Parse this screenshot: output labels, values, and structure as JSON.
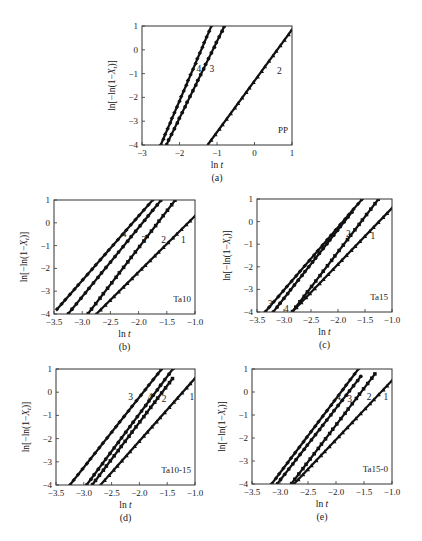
{
  "figure": {
    "panels_order": [
      "a",
      "b",
      "c",
      "d",
      "e"
    ]
  },
  "chart_data": [
    {
      "id": "a",
      "type": "line",
      "caption": "(a)",
      "sample": "PP",
      "xlabel": "ln t",
      "ylabel": "ln[−ln(1−Xt)]",
      "xlim": [
        -3,
        1
      ],
      "ylim": [
        -4,
        1
      ],
      "xticks": [
        "−3",
        "−2",
        "−1",
        "0",
        "1"
      ],
      "xtick_values": [
        -3,
        -2,
        -1,
        0,
        1
      ],
      "yticks": [
        "1",
        "0",
        "−1",
        "−2",
        "−3",
        "−4"
      ],
      "ytick_values": [
        1,
        0,
        -1,
        -2,
        -3,
        -4
      ],
      "grid": false,
      "frame": {
        "x": 142,
        "y": 26,
        "w": 150,
        "h": 119
      },
      "series": [
        {
          "name": "4",
          "marker": "diamond",
          "x": [
            -2.5,
            -1.15
          ],
          "y": [
            -4,
            1
          ],
          "label_at": [
            -1.55,
            -0.8
          ]
        },
        {
          "name": "3",
          "marker": "circle",
          "x": [
            -2.35,
            -0.8
          ],
          "y": [
            -4,
            1
          ],
          "label_at": [
            -1.2,
            -0.8
          ]
        },
        {
          "name": "2",
          "marker": "triangle",
          "x": [
            -1.25,
            1.0
          ],
          "y": [
            -4,
            0.85
          ],
          "label_at": [
            0.6,
            -0.9
          ]
        }
      ]
    },
    {
      "id": "b",
      "type": "line",
      "caption": "(b)",
      "sample": "Ta10",
      "xlabel": "ln t",
      "ylabel": "ln[−ln(1−Xt)]",
      "xlim": [
        -3.5,
        -1.0
      ],
      "ylim": [
        -4,
        1
      ],
      "xticks": [
        "−3.5",
        "−3.0",
        "−2.5",
        "−2.0",
        "−1.5",
        "−1.0"
      ],
      "xtick_values": [
        -3.5,
        -3.0,
        -2.5,
        -2.0,
        -1.5,
        -1.0
      ],
      "yticks": [
        "1",
        "0",
        "−1",
        "−2",
        "−3",
        "−4"
      ],
      "ytick_values": [
        1,
        0,
        -1,
        -2,
        -3,
        -4
      ],
      "grid": false,
      "frame": {
        "x": 54,
        "y": 200,
        "w": 141,
        "h": 114
      },
      "series": [
        {
          "name": "4",
          "marker": "diamond",
          "x": [
            -3.45,
            -1.75
          ],
          "y": [
            -3.8,
            1
          ],
          "label_at": [
            -2.3,
            -0.5
          ]
        },
        {
          "name": "3",
          "marker": "circle",
          "x": [
            -3.25,
            -1.6
          ],
          "y": [
            -4,
            1
          ],
          "label_at": [
            -1.95,
            -0.75
          ]
        },
        {
          "name": "2",
          "marker": "square",
          "x": [
            -2.9,
            -1.35
          ],
          "y": [
            -4,
            1
          ],
          "label_at": [
            -1.6,
            -0.75
          ]
        },
        {
          "name": "1",
          "marker": "triangle",
          "x": [
            -2.75,
            -1.0
          ],
          "y": [
            -4,
            0.3
          ],
          "label_at": [
            -1.25,
            -0.75
          ]
        }
      ]
    },
    {
      "id": "c",
      "type": "line",
      "caption": "(c)",
      "sample": "Ta15",
      "xlabel": "ln t",
      "ylabel": "ln[−ln(1−Xt)]",
      "xlim": [
        -3.5,
        -1.0
      ],
      "ylim": [
        -4,
        1
      ],
      "xticks": [
        "−3.5",
        "−3.0",
        "−2.5",
        "−2.0",
        "−1.5",
        "−1.0"
      ],
      "xtick_values": [
        -3.5,
        -3.0,
        -2.5,
        -2.0,
        -1.5,
        -1.0
      ],
      "yticks": [
        "1",
        "0",
        "−1",
        "−2",
        "−3",
        "−4"
      ],
      "ytick_values": [
        1,
        0,
        -1,
        -2,
        -3,
        -4
      ],
      "grid": false,
      "frame": {
        "x": 257,
        "y": 199,
        "w": 135,
        "h": 113
      },
      "series": [
        {
          "name": "3",
          "marker": "diamond",
          "x": [
            -3.35,
            -1.55
          ],
          "y": [
            -4,
            1
          ],
          "label_at": [
            -3.3,
            -3.65
          ]
        },
        {
          "name": "4",
          "marker": "circle",
          "x": [
            -3.2,
            -1.75
          ],
          "y": [
            -4,
            0.4
          ],
          "label_at": [
            -3.0,
            -3.85
          ]
        },
        {
          "name": "2",
          "marker": "square",
          "x": [
            -2.85,
            -1.25
          ],
          "y": [
            -4,
            1
          ],
          "label_at": [
            -1.85,
            -0.55
          ]
        },
        {
          "name": "1",
          "marker": "triangle",
          "x": [
            -2.85,
            -1.0
          ],
          "y": [
            -4,
            0.6
          ],
          "label_at": [
            -1.4,
            -0.65
          ]
        }
      ]
    },
    {
      "id": "d",
      "type": "line",
      "caption": "(d)",
      "sample": "Ta10-15",
      "xlabel": "ln t",
      "ylabel": "ln[−ln(1−Xt)]",
      "xlim": [
        -3.5,
        -1.0
      ],
      "ylim": [
        -4,
        1
      ],
      "xticks": [
        "−3.5",
        "−3.0",
        "−2.5",
        "−2.0",
        "−1.5",
        "−1.0"
      ],
      "xtick_values": [
        -3.5,
        -3.0,
        -2.5,
        -2.0,
        -1.5,
        -1.0
      ],
      "yticks": [
        "1",
        "0",
        "−1",
        "−2",
        "−3",
        "−4"
      ],
      "ytick_values": [
        1,
        0,
        -1,
        -2,
        -3,
        -4
      ],
      "grid": false,
      "frame": {
        "x": 56,
        "y": 369,
        "w": 139,
        "h": 116
      },
      "series": [
        {
          "name": "3",
          "marker": "diamond",
          "x": [
            -3.25,
            -1.6
          ],
          "y": [
            -4,
            1
          ],
          "label_at": [
            -2.2,
            -0.2
          ]
        },
        {
          "name": "4",
          "marker": "circle",
          "x": [
            -2.95,
            -1.4
          ],
          "y": [
            -4,
            1
          ],
          "label_at": [
            -1.85,
            -0.2
          ]
        },
        {
          "name": "2",
          "marker": "square",
          "x": [
            -2.85,
            -1.4
          ],
          "y": [
            -4,
            0.6
          ],
          "label_at": [
            -1.6,
            -0.3
          ]
        },
        {
          "name": "1",
          "marker": "triangle",
          "x": [
            -2.7,
            -1.0
          ],
          "y": [
            -4,
            0.6
          ],
          "label_at": [
            -1.1,
            -0.2
          ]
        }
      ]
    },
    {
      "id": "e",
      "type": "line",
      "caption": "(e)",
      "sample": "Ta15-0",
      "xlabel": "ln t",
      "ylabel": "ln[−ln(1−Xt)]",
      "xlim": [
        -3.5,
        -1.0
      ],
      "ylim": [
        -4,
        1
      ],
      "xticks": [
        "−3.5",
        "−3.0",
        "−2.5",
        "−2.0",
        "−1.5",
        "−1.0"
      ],
      "xtick_values": [
        -3.5,
        -3.0,
        -2.5,
        -2.0,
        -1.5,
        -1.0
      ],
      "yticks": [
        "1",
        "0",
        "−1",
        "−2",
        "−3",
        "−4"
      ],
      "ytick_values": [
        1,
        0,
        -1,
        -2,
        -3,
        -4
      ],
      "grid": false,
      "frame": {
        "x": 252,
        "y": 369,
        "w": 140,
        "h": 115
      },
      "series": [
        {
          "name": "4",
          "marker": "diamond",
          "x": [
            -3.15,
            -1.6
          ],
          "y": [
            -4,
            1
          ],
          "label_at": [
            -2.0,
            -0.2
          ]
        },
        {
          "name": "3",
          "marker": "circle",
          "x": [
            -3.05,
            -1.55
          ],
          "y": [
            -4,
            0.7
          ],
          "label_at": [
            -1.8,
            -0.3
          ]
        },
        {
          "name": "2",
          "marker": "square",
          "x": [
            -2.8,
            -1.3
          ],
          "y": [
            -4,
            0.8
          ],
          "label_at": [
            -1.45,
            -0.2
          ]
        },
        {
          "name": "1",
          "marker": "triangle",
          "x": [
            -2.75,
            -1.0
          ],
          "y": [
            -4,
            0.5
          ],
          "label_at": [
            -1.15,
            -0.2
          ]
        }
      ]
    }
  ]
}
